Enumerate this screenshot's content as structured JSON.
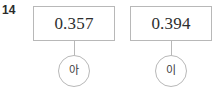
{
  "problem": {
    "number": "14"
  },
  "diagram": {
    "type": "value-label-pairs",
    "nodes": [
      {
        "value": "0.357",
        "label": "아",
        "label_romanized": "a"
      },
      {
        "value": "0.394",
        "label": "이",
        "label_romanized": "i"
      }
    ]
  },
  "style": {
    "border_color": "#b8b8b8",
    "text_color": "#2e2e2e",
    "number_color": "#2b2b2b",
    "background": "#ffffff"
  }
}
